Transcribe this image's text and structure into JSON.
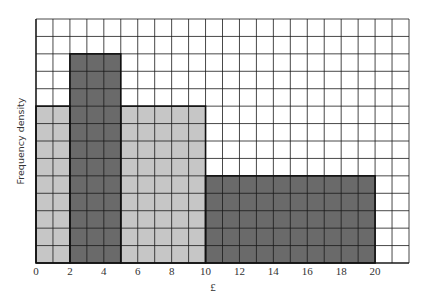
{
  "chart_data": {
    "type": "bar",
    "subtype": "histogram",
    "title": "",
    "xlabel": "£",
    "ylabel": "Frequency density",
    "xlim": [
      0,
      22
    ],
    "ylim": [
      0,
      14
    ],
    "grid": true,
    "x_ticks": [
      0,
      2,
      4,
      6,
      8,
      10,
      12,
      14,
      16,
      18,
      20
    ],
    "y_ticks_labeled": false,
    "bins": [
      {
        "from": 0,
        "to": 2,
        "height": 9,
        "shade": "light"
      },
      {
        "from": 2,
        "to": 5,
        "height": 12,
        "shade": "dark"
      },
      {
        "from": 5,
        "to": 10,
        "height": 9,
        "shade": "light"
      },
      {
        "from": 10,
        "to": 20,
        "height": 5,
        "shade": "dark"
      }
    ],
    "colors": {
      "light": "#c6c6c6",
      "dark": "#6a6a6a",
      "grid": "#1a1a1a",
      "background": "#ffffff"
    }
  }
}
